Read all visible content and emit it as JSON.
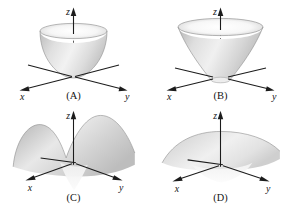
{
  "figure": {
    "background_color": "#ffffff",
    "layout": "2x2 grid of labeled 3D surface plots",
    "axis_color": "#1c1c1c",
    "surface_fill_light": "#f4f4f4",
    "surface_fill_mid": "#d2d2d2",
    "surface_fill_dark": "#a8a8a8"
  },
  "axis_labels": {
    "x": "x",
    "y": "y",
    "z": "z"
  },
  "panels": [
    {
      "id": "A",
      "caption": "(A)",
      "surface_name": "elliptic-paraboloid",
      "description": "Upward opening cup (bowl) with vertex at the origin; convex walls, elliptical rim at the top.",
      "opens": "upward",
      "vertex_at_origin": true,
      "axes": {
        "x": "x",
        "y": "y",
        "z": "z"
      }
    },
    {
      "id": "B",
      "caption": "(B)",
      "surface_name": "hyperboloid-of-one-sheet-upper-flare",
      "description": "Upward opening surface with concave flaring walls that widen rapidly near the top; narrow waist at the base near the origin.",
      "opens": "upward",
      "vertex_at_origin": true,
      "axes": {
        "x": "x",
        "y": "y",
        "z": "z"
      }
    },
    {
      "id": "C",
      "caption": "(C)",
      "surface_name": "monkey-saddle-twin-peaks",
      "description": "Saddle surface with two tall humps rising on the left and right and a dip through the middle at the origin.",
      "opens": "saddle",
      "vertex_at_origin": true,
      "axes": {
        "x": "x",
        "y": "y",
        "z": "z"
      }
    },
    {
      "id": "D",
      "caption": "(D)",
      "surface_name": "hyperbolic-paraboloid-shallow-ridge",
      "description": "Broad, gently arched ridge surface curving downward toward the front and back edges; nearly flat through the origin.",
      "opens": "saddle",
      "vertex_at_origin": true,
      "axes": {
        "x": "x",
        "y": "y",
        "z": "z"
      }
    }
  ]
}
